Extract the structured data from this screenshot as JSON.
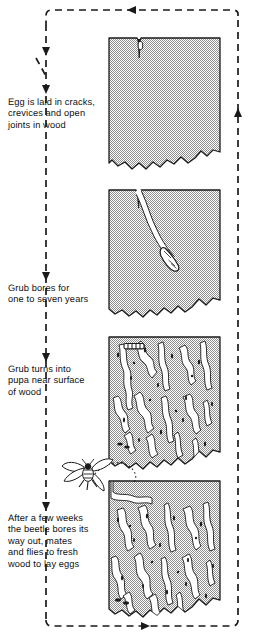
{
  "diagram": {
    "type": "cycle-diagram",
    "background_color": "#ffffff",
    "line_color": "#1a1a1a",
    "wood_fill_color": "#b9b9b9",
    "tunnel_fill_color": "#ffffff"
  },
  "captions": [
    {
      "id": "egg",
      "text": "Egg is laid in cracks,\ncrevices and open\njoints in wood"
    },
    {
      "id": "grub",
      "text": "Grub bores for\none to seven years"
    },
    {
      "id": "pupa",
      "text": "Grub turns into\npupa near surface\nof wood"
    },
    {
      "id": "beetle",
      "text": "After a few weeks\nthe beetle bores its\nway out, mates\nand flies to fresh\nwood to lay eggs"
    }
  ],
  "stages": [
    {
      "id": "stage-1-egg",
      "name": "egg-in-crack-panel",
      "order": 1,
      "description": "Wood block with surface crack containing a single egg"
    },
    {
      "id": "stage-2-grub",
      "name": "grub-boring-panel",
      "order": 2,
      "description": "Wood block with a single tunnel bored from the crack down to the grub"
    },
    {
      "id": "stage-3-pupa",
      "name": "pupa-panel",
      "order": 3,
      "description": "Wood block riddled with galleries, pupa near the top surface"
    },
    {
      "id": "stage-4-beetle",
      "name": "beetle-emergence-panel",
      "order": 4,
      "description": "Wood block riddled with galleries and an exit hole at the top surface"
    }
  ],
  "flow": {
    "style": "dashed",
    "arrows": [
      {
        "id": "arrow-top",
        "direction": "left"
      },
      {
        "id": "arrow-left-upper",
        "direction": "down"
      },
      {
        "id": "arrow-left-egg",
        "direction": "down"
      },
      {
        "id": "arrow-left-grub",
        "direction": "down"
      },
      {
        "id": "arrow-left-pupa",
        "direction": "down"
      },
      {
        "id": "arrow-left-beetle",
        "direction": "down"
      },
      {
        "id": "arrow-bottom",
        "direction": "right"
      },
      {
        "id": "arrow-right",
        "direction": "up"
      }
    ]
  },
  "insects": [
    {
      "id": "egg-marker",
      "name": "egg",
      "stage": 1
    },
    {
      "id": "grub-marker",
      "name": "grub",
      "stage": 2
    },
    {
      "id": "pupa-marker",
      "name": "pupa",
      "stage": 3
    },
    {
      "id": "beetle-marker",
      "name": "flying-beetle",
      "stage": 4
    }
  ]
}
